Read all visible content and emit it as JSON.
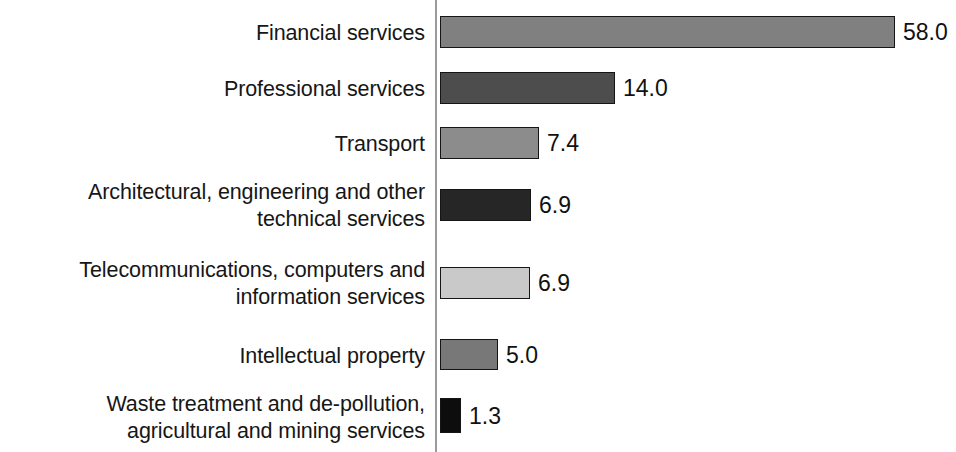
{
  "chart_data": {
    "type": "bar",
    "orientation": "horizontal",
    "title": "",
    "subtitle": "",
    "xlabel": "",
    "ylabel": "",
    "grid": false,
    "legend": null,
    "axis_line": true,
    "value_label_format": "one decimal",
    "categories": [
      "Financial services",
      "Professional services",
      "Transport",
      "Architectural, engineering and other\ntechnical services",
      "Telecommunications, computers and\ninformation services",
      "Intellectual property",
      "Waste treatment and de-pollution,\nagricultural and mining services"
    ],
    "values": [
      58.0,
      14.0,
      7.4,
      6.9,
      6.9,
      5.0,
      1.3
    ],
    "value_labels": [
      "58.0",
      "14.0",
      "7.4",
      "6.9",
      "6.9",
      "5.0",
      "1.3"
    ],
    "bar_colors": [
      "#808080",
      "#4d4d4d",
      "#8c8c8c",
      "#262626",
      "#c9c9c9",
      "#787878",
      "#0d0d0d"
    ],
    "bar_border_color": "#151515",
    "axis_color": "#9a9a9a",
    "text_color": "#161616",
    "background": "#ffffff",
    "bars": [
      {
        "category": "Financial services",
        "value": 58.0,
        "value_label": "58.0",
        "color": "#808080",
        "top": 16,
        "height": 32,
        "width": 455,
        "label_top": 20,
        "label_lines": 1
      },
      {
        "category": "Professional services",
        "value": 14.0,
        "value_label": "14.0",
        "color": "#4d4d4d",
        "top": 72,
        "height": 32,
        "width": 175,
        "label_top": 76,
        "label_lines": 1
      },
      {
        "category": "Transport",
        "value": 7.4,
        "value_label": "7.4",
        "color": "#8c8c8c",
        "top": 127,
        "height": 32,
        "width": 99,
        "label_top": 131,
        "label_lines": 1
      },
      {
        "category": "Architectural, engineering and other technical services",
        "value": 6.9,
        "value_label": "6.9",
        "color": "#262626",
        "top": 189,
        "height": 32,
        "width": 91,
        "label_top": 179,
        "label_lines": 2
      },
      {
        "category": "Telecommunications, computers and information services",
        "value": 6.9,
        "value_label": "6.9",
        "color": "#c9c9c9",
        "top": 267,
        "height": 32,
        "width": 90,
        "label_top": 257,
        "label_lines": 2
      },
      {
        "category": "Intellectual property",
        "value": 5.0,
        "value_label": "5.0",
        "color": "#787878",
        "top": 339,
        "height": 31,
        "width": 58,
        "label_top": 343,
        "label_lines": 1
      },
      {
        "category": "Waste treatment and de-pollution, agricultural and mining services",
        "value": 1.3,
        "value_label": "1.3",
        "color": "#0d0d0d",
        "top": 398,
        "height": 35,
        "width": 21,
        "label_top": 391,
        "label_lines": 2
      }
    ]
  }
}
